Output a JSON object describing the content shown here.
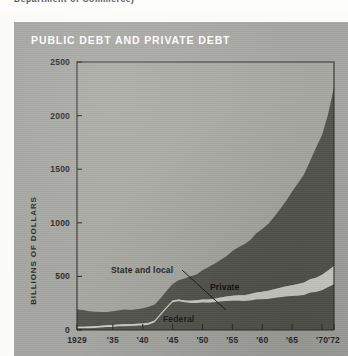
{
  "caption": {
    "text": "Department of Commerce)"
  },
  "figure": {
    "title": "PUBLIC DEBT AND PRIVATE DEBT",
    "panel_color": "#a6a6a2",
    "title_color": "#ffffff"
  },
  "axes": {
    "y_title": "BILLIONS OF DOLLARS",
    "y_ticks": [
      "0",
      "500",
      "1000",
      "1500",
      "2000",
      "2500"
    ],
    "x_ticks": [
      "1929",
      "'35",
      "'40",
      "'45",
      "'50",
      "'55",
      "'60",
      "'65",
      "'70",
      "'72"
    ]
  },
  "annotations": {
    "state_and_local": "State and local",
    "private": "Private",
    "federal": "Federal"
  },
  "chart_data": {
    "type": "area",
    "title": "PUBLIC DEBT AND PRIVATE DEBT",
    "xlabel": "",
    "ylabel": "BILLIONS OF DOLLARS",
    "ylim": [
      0,
      2500
    ],
    "xlim": [
      1929,
      1972
    ],
    "grid": false,
    "legend": "inline-annotations",
    "stacked": true,
    "y_ticks": [
      0,
      500,
      1000,
      1500,
      2000,
      2500
    ],
    "x_tick_values": [
      1929,
      1935,
      1940,
      1945,
      1950,
      1955,
      1960,
      1965,
      1970,
      1972
    ],
    "x_tick_labels": [
      "1929",
      "'35",
      "'40",
      "'45",
      "'50",
      "'55",
      "'60",
      "'65",
      "'70",
      "'72"
    ],
    "colors": {
      "federal": "#55564f",
      "state_and_local": "#cfd0c8",
      "private": "#55564f",
      "background": "#a6a6a2"
    },
    "x": [
      1929,
      1930,
      1931,
      1932,
      1933,
      1934,
      1935,
      1936,
      1937,
      1938,
      1939,
      1940,
      1941,
      1942,
      1943,
      1944,
      1945,
      1946,
      1947,
      1948,
      1949,
      1950,
      1951,
      1952,
      1953,
      1954,
      1955,
      1956,
      1957,
      1958,
      1959,
      1960,
      1961,
      1962,
      1963,
      1964,
      1965,
      1966,
      1967,
      1968,
      1969,
      1970,
      1971,
      1972
    ],
    "series": [
      {
        "name": "Federal",
        "values": [
          17,
          16,
          17,
          19,
          23,
          27,
          29,
          34,
          36,
          37,
          40,
          43,
          49,
          72,
          137,
          201,
          259,
          269,
          258,
          252,
          253,
          257,
          255,
          259,
          266,
          271,
          274,
          273,
          271,
          276,
          285,
          287,
          289,
          298,
          306,
          312,
          317,
          320,
          326,
          348,
          354,
          371,
          398,
          427
        ]
      },
      {
        "name": "State and local",
        "values": [
          14,
          15,
          16,
          17,
          17,
          17,
          17,
          17,
          17,
          17,
          18,
          18,
          18,
          17,
          16,
          16,
          16,
          16,
          18,
          21,
          24,
          27,
          30,
          33,
          37,
          42,
          46,
          50,
          54,
          60,
          65,
          70,
          76,
          82,
          88,
          95,
          101,
          108,
          116,
          125,
          134,
          145,
          158,
          170
        ]
      },
      {
        "name": "Private",
        "values": [
          161,
          155,
          142,
          134,
          127,
          125,
          128,
          133,
          138,
          133,
          136,
          142,
          151,
          148,
          144,
          148,
          153,
          178,
          204,
          228,
          241,
          274,
          302,
          327,
          351,
          374,
          417,
          449,
          476,
          504,
          553,
          586,
          624,
          676,
          734,
          799,
          875,
          944,
          1010,
          1104,
          1215,
          1304,
          1455,
          1670
        ]
      }
    ]
  }
}
